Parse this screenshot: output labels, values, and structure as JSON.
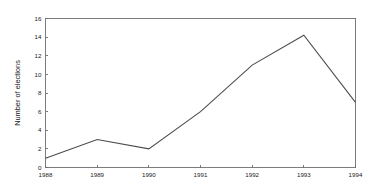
{
  "chart_data": {
    "type": "line",
    "title": "",
    "subtitle": "",
    "xlabel": "",
    "ylabel": "Number of elections",
    "categories": [
      "1988",
      "1989",
      "1990",
      "1991",
      "1992",
      "1993",
      "1994"
    ],
    "x": [
      1988,
      1989,
      1990,
      1991,
      1992,
      1993,
      1994
    ],
    "values": [
      1.0,
      3.0,
      2.0,
      6.0,
      11.0,
      14.2,
      7.0
    ],
    "series": [
      {
        "name": "Number of elections",
        "values": [
          1.0,
          3.0,
          2.0,
          6.0,
          11.0,
          14.2,
          7.0
        ]
      }
    ],
    "xlim": [
      1988,
      1994
    ],
    "ylim": [
      0,
      16
    ],
    "yticks": [
      0,
      2,
      4,
      6,
      8,
      10,
      12,
      14,
      16
    ],
    "ytick_labels": [
      "0",
      "2",
      "4",
      "6",
      "8",
      "10",
      "12",
      "14",
      "16"
    ],
    "xtick_labels": [
      "1988",
      "1989",
      "1990",
      "1991",
      "1992",
      "1993",
      "1994"
    ],
    "grid": false,
    "legend": false,
    "legend_position": "none",
    "markers": false,
    "line_color": "#4a4a4a",
    "axis_color": "#6e6e6e",
    "background_color": "#ffffff",
    "annotations": []
  }
}
